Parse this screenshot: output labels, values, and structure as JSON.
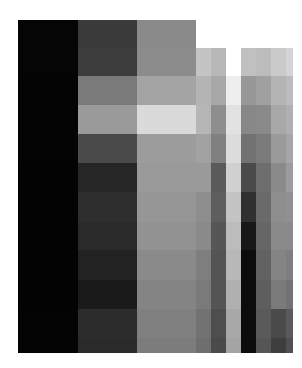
{
  "image": {
    "description": "Pixelated grayscale mosaic (heavily downsampled image)",
    "background": "#ffffff",
    "columns": [
      {
        "x": 18,
        "w": 60
      },
      {
        "x": 78,
        "w": 59
      },
      {
        "x": 137,
        "w": 59
      },
      {
        "x": 196,
        "w": 15
      },
      {
        "x": 211,
        "w": 15
      },
      {
        "x": 226,
        "w": 15
      },
      {
        "x": 241,
        "w": 15
      },
      {
        "x": 256,
        "w": 15
      },
      {
        "x": 271,
        "w": 15
      },
      {
        "x": 286,
        "w": 7
      }
    ],
    "rows": [
      {
        "y": 20,
        "h": 28
      },
      {
        "y": 48,
        "h": 28
      },
      {
        "y": 76,
        "h": 29
      },
      {
        "y": 105,
        "h": 29
      },
      {
        "y": 134,
        "h": 29
      },
      {
        "y": 163,
        "h": 29
      },
      {
        "y": 192,
        "h": 30
      },
      {
        "y": 222,
        "h": 28
      },
      {
        "y": 250,
        "h": 30
      },
      {
        "y": 280,
        "h": 29
      },
      {
        "y": 309,
        "h": 29
      },
      {
        "y": 338,
        "h": 15
      }
    ],
    "cells": [
      [
        "#050505",
        "#3a3a3a",
        "#8a8a8a",
        null,
        null,
        null,
        null,
        null,
        null,
        null
      ],
      [
        "#050505",
        "#3c3c3c",
        "#8c8c8c",
        "#c4c4c4",
        "#b8b8b8",
        "#ffffff",
        "#c0c0c0",
        "#bcbcbc",
        "#cacaca",
        "#d4d4d4"
      ],
      [
        "#040404",
        "#7a7a7a",
        "#a4a4a4",
        "#b4b4b4",
        "#a8a8a8",
        "#eeeeee",
        "#989898",
        "#a0a0a0",
        "#b4b4b4",
        "#bcbcbc"
      ],
      [
        "#040404",
        "#9a9a9a",
        "#dadada",
        "#b6b6b6",
        "#8e8e8e",
        "#e2e2e2",
        "#888888",
        "#8a8a8a",
        "#a8a8a8",
        "#b0b0b0"
      ],
      [
        "#040404",
        "#4a4a4a",
        "#9c9c9c",
        "#a2a2a2",
        "#808080",
        "#dcdcdc",
        "#727272",
        "#7a7a7a",
        "#9a9a9a",
        "#a6a6a6"
      ],
      [
        "#030303",
        "#262626",
        "#9a9a9a",
        "#9a9a9a",
        "#5a5a5a",
        "#d0d0d0",
        "#4a4a4a",
        "#6e6e6e",
        "#8a8a8a",
        "#9c9c9c"
      ],
      [
        "#030303",
        "#2e2e2e",
        "#969696",
        "#8e8e8e",
        "#5e5e5e",
        "#c4c4c4",
        "#303030",
        "#6a6a6a",
        "#8e8e8e",
        "#909090"
      ],
      [
        "#030303",
        "#2a2a2a",
        "#929292",
        "#8a8a8a",
        "#565656",
        "#bcbcbc",
        "#181818",
        "#666666",
        "#8a8a8a",
        "#8a8a8a"
      ],
      [
        "#030303",
        "#222222",
        "#8a8a8a",
        "#7e7e7e",
        "#545454",
        "#b8b8b8",
        "#0c0c0c",
        "#626262",
        "#848484",
        "#7e7e7e"
      ],
      [
        "#030303",
        "#1a1a1a",
        "#848484",
        "#7a7a7a",
        "#545454",
        "#b0b0b0",
        "#0c0c0c",
        "#5e5e5e",
        "#7a7a7a",
        "#727272"
      ],
      [
        "#040404",
        "#2c2c2c",
        "#808080",
        "#727272",
        "#4e4e4e",
        "#a8a8a8",
        "#0c0c0c",
        "#5a5a5a",
        "#4a4a4a",
        "#5a5a5a"
      ],
      [
        "#040404",
        "#2a2a2a",
        "#7c7c7c",
        "#6e6e6e",
        "#4a4a4a",
        "#a4a4a4",
        "#0c0c0c",
        "#565656",
        "#3e3e3e",
        "#505050"
      ]
    ]
  }
}
